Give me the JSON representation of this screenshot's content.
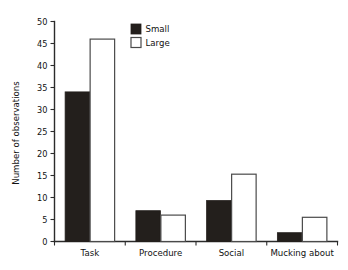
{
  "chart_data": {
    "type": "bar",
    "title": "",
    "xlabel": "",
    "ylabel": "Number of observations",
    "categories": [
      "Task",
      "Procedure",
      "Social",
      "Mucking about"
    ],
    "series": [
      {
        "name": "Small",
        "color": "#231f1c",
        "values": [
          34,
          7,
          9.3,
          2
        ]
      },
      {
        "name": "Large",
        "color": "#ffffff",
        "values": [
          46,
          6,
          15.3,
          5.5
        ]
      }
    ],
    "ylim": [
      0,
      50
    ],
    "yticks": [
      0,
      5,
      10,
      15,
      20,
      25,
      30,
      35,
      40,
      45,
      50
    ],
    "ytick_labels": [
      "0",
      "5",
      "10",
      "15",
      "20",
      "25",
      "30",
      "35",
      "40",
      "45",
      "50"
    ],
    "grid": false,
    "legend_position": "top-center",
    "legend": [
      {
        "label": "Small",
        "swatch": "filled-square"
      },
      {
        "label": "Large",
        "swatch": "open-square"
      }
    ]
  }
}
